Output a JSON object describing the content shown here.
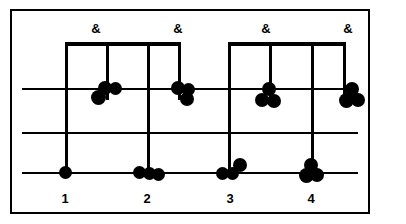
{
  "figure": {
    "kind": "drum-notation-staff",
    "width": 406,
    "height": 224,
    "ink_color": "#000000",
    "paper_color": "#ffffff"
  },
  "frame": {
    "x": 10,
    "y": 9,
    "width": 360,
    "height": 205,
    "stroke": 2
  },
  "staff": {
    "line_left": 22,
    "line_right": 358,
    "lines": [
      {
        "name": "top-line",
        "y": 88
      },
      {
        "name": "middle-line",
        "y": 132
      },
      {
        "name": "bottom-line",
        "y": 172
      }
    ]
  },
  "beams": [
    {
      "name": "beam-beat-1-and",
      "x": 65,
      "y": 42,
      "width": 114
    },
    {
      "name": "beam-beat-3-and",
      "x": 228,
      "y": 42,
      "width": 116
    }
  ],
  "stems": [
    {
      "name": "stem-beat-1",
      "x": 65,
      "top": 42,
      "bottom": 178
    },
    {
      "name": "stem-beat-1-and",
      "x": 106,
      "top": 42,
      "bottom": 100
    },
    {
      "name": "stem-beat-2",
      "x": 147,
      "top": 42,
      "bottom": 178
    },
    {
      "name": "stem-beat-2-and",
      "x": 178,
      "top": 42,
      "bottom": 100
    },
    {
      "name": "stem-beat-3",
      "x": 228,
      "top": 42,
      "bottom": 178
    },
    {
      "name": "stem-beat-3-and",
      "x": 269,
      "top": 42,
      "bottom": 100
    },
    {
      "name": "stem-beat-4",
      "x": 311,
      "top": 42,
      "bottom": 178
    },
    {
      "name": "stem-beat-4-and",
      "x": 343,
      "top": 42,
      "bottom": 100
    }
  ],
  "noteheads": [
    {
      "name": "notehead-top-1",
      "cx": 98,
      "cy": 97,
      "d": 15
    },
    {
      "name": "notehead-top-2",
      "cx": 105,
      "cy": 88,
      "d": 14
    },
    {
      "name": "notehead-top-3",
      "cx": 115,
      "cy": 88,
      "d": 13
    },
    {
      "name": "notehead-top-4",
      "cx": 178,
      "cy": 88,
      "d": 14
    },
    {
      "name": "notehead-top-5",
      "cx": 188,
      "cy": 89,
      "d": 13
    },
    {
      "name": "notehead-top-6",
      "cx": 187,
      "cy": 99,
      "d": 14
    },
    {
      "name": "notehead-top-7",
      "cx": 269,
      "cy": 89,
      "d": 14
    },
    {
      "name": "notehead-top-8",
      "cx": 262,
      "cy": 100,
      "d": 14
    },
    {
      "name": "notehead-top-9",
      "cx": 274,
      "cy": 101,
      "d": 14
    },
    {
      "name": "notehead-top-10",
      "cx": 352,
      "cy": 89,
      "d": 14
    },
    {
      "name": "notehead-top-11",
      "cx": 346,
      "cy": 100,
      "d": 15
    },
    {
      "name": "notehead-top-12",
      "cx": 358,
      "cy": 100,
      "d": 14
    },
    {
      "name": "notehead-bottom-1",
      "cx": 65,
      "cy": 172,
      "d": 13
    },
    {
      "name": "notehead-bottom-2",
      "cx": 139,
      "cy": 172,
      "d": 13
    },
    {
      "name": "notehead-bottom-3",
      "cx": 149,
      "cy": 173,
      "d": 13
    },
    {
      "name": "notehead-bottom-4",
      "cx": 158,
      "cy": 174,
      "d": 13
    },
    {
      "name": "notehead-bottom-5",
      "cx": 222,
      "cy": 173,
      "d": 13
    },
    {
      "name": "notehead-bottom-6",
      "cx": 232,
      "cy": 173,
      "d": 13
    },
    {
      "name": "notehead-bottom-7",
      "cx": 240,
      "cy": 165,
      "d": 14
    },
    {
      "name": "notehead-bottom-8",
      "cx": 311,
      "cy": 165,
      "d": 14
    },
    {
      "name": "notehead-bottom-9",
      "cx": 306,
      "cy": 175,
      "d": 15
    },
    {
      "name": "notehead-bottom-10",
      "cx": 317,
      "cy": 175,
      "d": 14
    }
  ],
  "count_labels": [
    {
      "name": "count-label-1",
      "text": "1",
      "x": 65,
      "y": 192
    },
    {
      "name": "count-label-2",
      "text": "2",
      "x": 147,
      "y": 192
    },
    {
      "name": "count-label-3",
      "text": "3",
      "x": 230,
      "y": 192
    },
    {
      "name": "count-label-4",
      "text": "4",
      "x": 311,
      "y": 192
    }
  ],
  "and_labels": [
    {
      "name": "and-label-1",
      "text": "&",
      "x": 96,
      "y": 22
    },
    {
      "name": "and-label-2",
      "text": "&",
      "x": 178,
      "y": 22
    },
    {
      "name": "and-label-3",
      "text": "&",
      "x": 266,
      "y": 22
    },
    {
      "name": "and-label-4",
      "text": "&",
      "x": 348,
      "y": 22
    }
  ]
}
